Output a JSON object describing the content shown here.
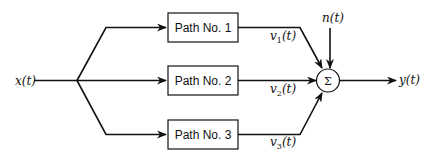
{
  "diagram": {
    "input": "x(t)",
    "output": "y(t)",
    "noise": "n(t)",
    "summer_symbol": "Σ",
    "paths": [
      {
        "label": "Path No. 1",
        "output": "v",
        "sub": "1",
        "arg": "(t)"
      },
      {
        "label": "Path No. 2",
        "output": "v",
        "sub": "2",
        "arg": "(t)"
      },
      {
        "label": "Path No. 3",
        "output": "v",
        "sub": "3",
        "arg": "(t)"
      }
    ],
    "color": "#111111"
  }
}
